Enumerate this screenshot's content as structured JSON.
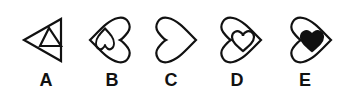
{
  "options": [
    {
      "label": "A",
      "shape": "triangle-with-inner-triangle",
      "center_x": 46
    },
    {
      "label": "B",
      "shape": "left-heart-with-inner-inverted-heart",
      "center_x": 112
    },
    {
      "label": "C",
      "shape": "right-heart-empty",
      "center_x": 171
    },
    {
      "label": "D",
      "shape": "right-heart-with-inner-outline-heart",
      "center_x": 237
    },
    {
      "label": "E",
      "shape": "right-heart-with-inner-filled-heart",
      "center_x": 305
    }
  ],
  "colors": {
    "stroke": "#111111",
    "fill": "#111111",
    "background": "#ffffff"
  }
}
